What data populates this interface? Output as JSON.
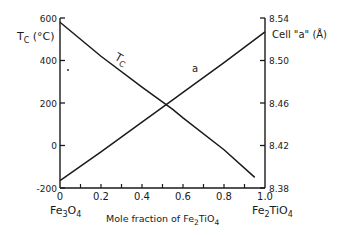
{
  "chart_data": {
    "type": "line",
    "title": "",
    "xlabel": "Mole fraction of Fe2TiO4",
    "xlabel_prefix": "Mole fraction of",
    "xlabel_formula": "Fe2TiO4",
    "ylabel_left": "Tc (°C)",
    "ylabel_right": "Cell \"a\" (Å)",
    "xlim": [
      0,
      1.0
    ],
    "ylim_left": [
      -200,
      600
    ],
    "ylim_right": [
      8.38,
      8.54
    ],
    "x_ticks": [
      "0",
      "0.2",
      "0.4",
      "0.6",
      "0.8",
      "1.0"
    ],
    "x_minor_ticks": [
      0.1,
      0.3,
      0.5,
      0.7,
      0.9
    ],
    "y_left_ticks": [
      "600",
      "400",
      "200",
      "0",
      "-200"
    ],
    "y_right_ticks": [
      "8.54",
      "8.50",
      "8.46",
      "8.42",
      "8.38"
    ],
    "x_end_labels": {
      "left": "Fe3O4",
      "right": "Fe2TiO4"
    },
    "grid": false,
    "series": [
      {
        "name": "Tc",
        "axis": "left",
        "label": "Tc",
        "x": [
          0,
          0.2,
          0.4,
          0.55,
          0.6,
          0.8,
          0.95
        ],
        "values": [
          580,
          420,
          275,
          170,
          130,
          -20,
          -150
        ]
      },
      {
        "name": "a",
        "axis": "right",
        "label": "a",
        "x": [
          0,
          0.2,
          0.4,
          0.55,
          0.6,
          0.8,
          1.0
        ],
        "values": [
          8.387,
          8.414,
          8.442,
          8.463,
          8.47,
          8.498,
          8.527
        ]
      }
    ],
    "annotations": [
      {
        "text": "Tc",
        "near_series": "Tc",
        "x": 0.27
      },
      {
        "text": "a",
        "near_series": "a",
        "x": 0.66
      }
    ]
  },
  "labels": {
    "tc_axis_main": "T",
    "tc_axis_sub": "C",
    "tc_axis_unit": " (°C)",
    "cell_axis": "Cell \"a\" (Å)",
    "xlabel_prefix": "Mole fraction of  Fe",
    "xlabel_sub1": "2",
    "xlabel_mid": "TiO",
    "xlabel_sub2": "4",
    "fe3o4_main": "Fe",
    "fe3o4_s1": "3",
    "fe3o4_mid": "O",
    "fe3o4_s2": "4",
    "fe2tio4_main": "Fe",
    "fe2tio4_s1": "2",
    "fe2tio4_mid": "TiO",
    "fe2tio4_s2": "4",
    "tc_curve_main": "T",
    "tc_curve_sub": "C",
    "a_curve": "a"
  },
  "colors": {
    "ink": "#1a1a1a",
    "background": "#ffffff"
  }
}
